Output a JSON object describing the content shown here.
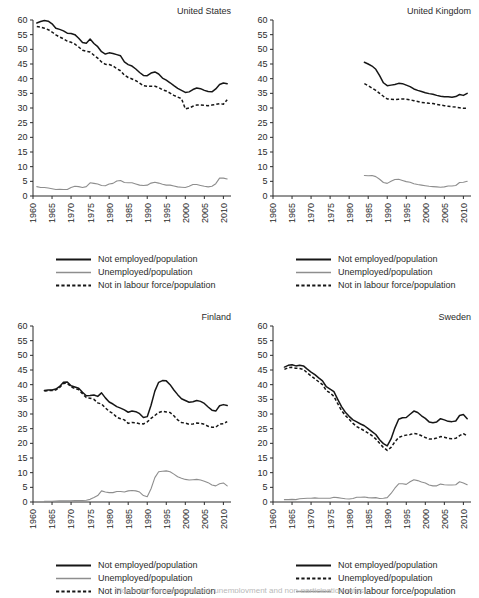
{
  "figure": {
    "panel_count": 4,
    "y_axis": {
      "min": 0,
      "max": 60,
      "ticks": [
        0,
        5,
        10,
        15,
        20,
        25,
        30,
        35,
        40,
        45,
        50,
        55,
        60
      ]
    },
    "x_axis": {
      "min": 1960,
      "max": 2012,
      "ticks": [
        1960,
        1965,
        1970,
        1975,
        1980,
        1985,
        1990,
        1995,
        2000,
        2005,
        2010
      ]
    },
    "series_labels": {
      "not_employed": "Not employed/population",
      "unemployed": "Unemployed/population",
      "not_in_labour_force": "Not in labour force/population"
    },
    "colors": {
      "solid": "#161616",
      "grey": "#8e8e8e",
      "dotted": "#161616",
      "axis": "#2b2b2b"
    },
    "footer_partial_caption": "Figure 3. Non-employment, unemployment and non-participation rates"
  },
  "panels": [
    {
      "id": "united-states",
      "title": "United States",
      "legend": [
        {
          "label": "Not employed/population",
          "key": "solid"
        },
        {
          "label": "Unemployed/population",
          "key": "grey"
        },
        {
          "label": "Not in labour force/population",
          "key": "dotted"
        }
      ]
    },
    {
      "id": "united-kingdom",
      "title": "United Kingdom",
      "legend": [
        {
          "label": "Not employed/population",
          "key": "solid"
        },
        {
          "label": "Unemployed/population",
          "key": "grey"
        },
        {
          "label": "Not in labour force/population",
          "key": "dotted"
        }
      ]
    },
    {
      "id": "finland",
      "title": "Finland",
      "legend": [
        {
          "label": "Not employed/population",
          "key": "solid"
        },
        {
          "label": "Unemployed/population",
          "key": "grey"
        },
        {
          "label": "Not in labour force/population",
          "key": "dotted"
        }
      ]
    },
    {
      "id": "sweden",
      "title": "Sweden",
      "legend": [
        {
          "label": "Not employed/population",
          "key": "solid"
        },
        {
          "label": "Unemployed/population",
          "key": "dotted"
        },
        {
          "label": "Not in labour force/population",
          "key": "grey"
        }
      ]
    }
  ],
  "chart_data": [
    {
      "type": "line",
      "panel": "United States",
      "title": "United States",
      "xlabel": "",
      "ylabel": "",
      "xlim": [
        1960,
        2012
      ],
      "ylim": [
        0,
        60
      ],
      "grid": false,
      "legend_position": "below-plot",
      "x": [
        1961,
        1962,
        1963,
        1964,
        1965,
        1966,
        1967,
        1968,
        1969,
        1970,
        1971,
        1972,
        1973,
        1974,
        1975,
        1976,
        1977,
        1978,
        1979,
        1980,
        1981,
        1982,
        1983,
        1984,
        1985,
        1986,
        1987,
        1988,
        1989,
        1990,
        1991,
        1992,
        1993,
        1994,
        1995,
        1996,
        1997,
        1998,
        1999,
        2000,
        2001,
        2002,
        2003,
        2004,
        2005,
        2006,
        2007,
        2008,
        2009,
        2010,
        2011
      ],
      "series": [
        {
          "name": "Not employed/population",
          "style": "solid",
          "values": [
            59.0,
            59.5,
            59.8,
            59.6,
            58.7,
            57.2,
            56.8,
            56.3,
            55.5,
            55.4,
            55.0,
            53.8,
            52.3,
            52.1,
            53.5,
            52.0,
            50.9,
            49.2,
            48.4,
            48.8,
            48.6,
            48.2,
            47.8,
            45.7,
            44.8,
            44.3,
            43.3,
            42.1,
            41.1,
            41.0,
            41.9,
            42.3,
            41.6,
            40.2,
            39.5,
            38.6,
            37.6,
            36.7,
            36.0,
            35.3,
            35.5,
            36.3,
            36.8,
            36.6,
            36.0,
            35.6,
            35.5,
            36.5,
            38.0,
            38.5,
            38.3
          ]
        },
        {
          "name": "Unemployed/population",
          "style": "grey",
          "values": [
            3.2,
            2.9,
            2.9,
            2.7,
            2.5,
            2.2,
            2.3,
            2.2,
            2.2,
            2.9,
            3.3,
            3.2,
            2.9,
            3.2,
            4.5,
            4.3,
            4.1,
            3.6,
            3.5,
            4.1,
            4.3,
            5.1,
            5.3,
            4.6,
            4.5,
            4.5,
            4.1,
            3.7,
            3.6,
            3.7,
            4.4,
            4.7,
            4.4,
            4.0,
            3.7,
            3.7,
            3.4,
            3.1,
            3.0,
            2.9,
            3.3,
            3.9,
            3.9,
            3.6,
            3.3,
            3.1,
            3.3,
            4.2,
            6.1,
            6.1,
            5.8
          ]
        },
        {
          "name": "Not in labour force/population",
          "style": "dotted",
          "values": [
            57.8,
            57.6,
            57.2,
            56.7,
            55.9,
            54.9,
            54.2,
            53.6,
            52.8,
            52.4,
            51.8,
            50.8,
            49.7,
            49.3,
            49.1,
            48.0,
            47.0,
            45.7,
            44.9,
            44.8,
            44.4,
            43.4,
            42.7,
            41.2,
            40.4,
            39.9,
            39.3,
            38.5,
            37.6,
            37.4,
            37.4,
            37.4,
            37.0,
            36.2,
            35.8,
            35.1,
            34.3,
            33.7,
            33.2,
            29.7,
            30.0,
            30.6,
            31.0,
            31.0,
            30.9,
            30.8,
            31.0,
            31.2,
            31.5,
            31.3,
            32.8
          ]
        }
      ]
    },
    {
      "type": "line",
      "panel": "United Kingdom",
      "title": "United Kingdom",
      "xlabel": "",
      "ylabel": "",
      "xlim": [
        1960,
        2012
      ],
      "ylim": [
        0,
        60
      ],
      "grid": false,
      "legend_position": "below-plot",
      "x": [
        1984,
        1985,
        1986,
        1987,
        1988,
        1989,
        1990,
        1991,
        1992,
        1993,
        1994,
        1995,
        1996,
        1997,
        1998,
        1999,
        2000,
        2001,
        2002,
        2003,
        2004,
        2005,
        2006,
        2007,
        2008,
        2009,
        2010,
        2011
      ],
      "series": [
        {
          "name": "Not employed/population",
          "style": "solid",
          "values": [
            45.6,
            45.0,
            44.3,
            43.2,
            41.0,
            38.6,
            37.6,
            37.8,
            38.0,
            38.4,
            38.3,
            37.8,
            37.3,
            36.5,
            36.0,
            35.6,
            35.2,
            34.9,
            34.7,
            34.3,
            34.0,
            33.8,
            33.8,
            33.7,
            33.9,
            34.6,
            34.3,
            35.0
          ]
        },
        {
          "name": "Unemployed/population",
          "style": "grey",
          "values": [
            7.0,
            6.9,
            7.0,
            6.6,
            5.7,
            4.6,
            4.3,
            5.0,
            5.6,
            5.7,
            5.3,
            4.9,
            4.7,
            4.2,
            3.9,
            3.7,
            3.5,
            3.3,
            3.2,
            3.1,
            3.0,
            3.1,
            3.4,
            3.4,
            3.6,
            4.6,
            4.7,
            5.0
          ]
        },
        {
          "name": "Not in labour force/population",
          "style": "dotted",
          "values": [
            38.3,
            37.6,
            36.8,
            36.0,
            35.0,
            34.0,
            33.1,
            33.0,
            32.9,
            33.0,
            33.1,
            33.0,
            32.8,
            32.5,
            32.2,
            31.9,
            31.8,
            31.6,
            31.5,
            31.2,
            31.0,
            30.8,
            30.6,
            30.4,
            30.3,
            30.1,
            29.9,
            29.9
          ]
        }
      ]
    },
    {
      "type": "line",
      "panel": "Finland",
      "title": "Finland",
      "xlabel": "",
      "ylabel": "",
      "xlim": [
        1960,
        2012
      ],
      "ylim": [
        0,
        60
      ],
      "grid": false,
      "legend_position": "below-plot",
      "x": [
        1963,
        1964,
        1965,
        1966,
        1967,
        1968,
        1969,
        1970,
        1971,
        1972,
        1973,
        1974,
        1975,
        1976,
        1977,
        1978,
        1979,
        1980,
        1981,
        1982,
        1983,
        1984,
        1985,
        1986,
        1987,
        1988,
        1989,
        1990,
        1991,
        1992,
        1993,
        1994,
        1995,
        1996,
        1997,
        1998,
        1999,
        2000,
        2001,
        2002,
        2003,
        2004,
        2005,
        2006,
        2007,
        2008,
        2009,
        2010,
        2011
      ],
      "series": [
        {
          "name": "Not employed/population",
          "style": "solid",
          "values": [
            38.0,
            38.2,
            38.2,
            38.5,
            39.4,
            40.8,
            40.9,
            39.6,
            39.2,
            38.8,
            37.4,
            36.2,
            36.3,
            36.5,
            36.0,
            37.2,
            35.5,
            34.1,
            33.4,
            32.5,
            32.0,
            31.4,
            30.6,
            31.0,
            30.8,
            30.1,
            28.8,
            29.1,
            33.0,
            37.8,
            40.8,
            41.4,
            41.3,
            40.0,
            38.2,
            36.6,
            35.2,
            34.6,
            34.0,
            34.2,
            34.6,
            34.3,
            33.6,
            32.4,
            31.3,
            31.0,
            32.8,
            33.2,
            32.9
          ]
        },
        {
          "name": "Unemployed/population",
          "style": "grey",
          "values": [
            0.2,
            0.2,
            0.2,
            0.3,
            0.4,
            0.4,
            0.4,
            0.4,
            0.5,
            0.5,
            0.5,
            0.6,
            0.9,
            1.5,
            2.2,
            3.8,
            3.4,
            3.2,
            3.2,
            3.6,
            3.6,
            3.4,
            3.8,
            3.9,
            3.8,
            3.4,
            2.2,
            1.8,
            4.5,
            8.3,
            10.3,
            10.5,
            10.6,
            10.3,
            9.5,
            8.6,
            8.1,
            7.7,
            7.5,
            7.6,
            7.7,
            7.5,
            7.1,
            6.6,
            5.8,
            5.5,
            6.2,
            6.5,
            5.5
          ]
        },
        {
          "name": "Not in labour force/population",
          "style": "dotted",
          "values": [
            37.8,
            38.0,
            38.0,
            38.2,
            39.0,
            40.4,
            40.5,
            39.2,
            38.7,
            38.3,
            36.9,
            35.6,
            35.4,
            35.0,
            33.8,
            33.4,
            32.1,
            30.9,
            30.2,
            28.9,
            28.4,
            28.0,
            26.8,
            27.1,
            27.0,
            26.7,
            26.6,
            27.3,
            28.5,
            29.5,
            30.5,
            30.9,
            30.7,
            30.5,
            29.4,
            28.0,
            27.1,
            26.9,
            26.5,
            26.6,
            26.9,
            26.8,
            26.5,
            25.8,
            25.5,
            25.5,
            26.6,
            26.7,
            27.4
          ]
        }
      ]
    },
    {
      "type": "line",
      "panel": "Sweden",
      "title": "Sweden",
      "xlabel": "",
      "ylabel": "",
      "xlim": [
        1960,
        2012
      ],
      "ylim": [
        0,
        60
      ],
      "grid": false,
      "legend_position": "below-plot",
      "x": [
        1963,
        1964,
        1965,
        1966,
        1967,
        1968,
        1969,
        1970,
        1971,
        1972,
        1973,
        1974,
        1975,
        1976,
        1977,
        1978,
        1979,
        1980,
        1981,
        1982,
        1983,
        1984,
        1985,
        1986,
        1987,
        1988,
        1989,
        1990,
        1991,
        1992,
        1993,
        1994,
        1995,
        1996,
        1997,
        1998,
        1999,
        2000,
        2001,
        2002,
        2003,
        2004,
        2005,
        2006,
        2007,
        2008,
        2009,
        2010,
        2011
      ],
      "series": [
        {
          "name": "Not employed/population",
          "style": "solid",
          "values": [
            46.0,
            46.6,
            46.8,
            46.4,
            46.6,
            46.4,
            45.3,
            44.3,
            43.4,
            42.3,
            41.3,
            39.3,
            38.5,
            37.6,
            35.0,
            32.5,
            30.6,
            29.2,
            28.0,
            27.3,
            26.6,
            26.0,
            25.0,
            24.0,
            23.0,
            21.2,
            19.9,
            19.1,
            21.5,
            25.2,
            28.2,
            28.7,
            28.8,
            29.9,
            31.0,
            30.5,
            29.4,
            28.5,
            27.3,
            27.0,
            27.3,
            28.4,
            28.0,
            27.5,
            27.4,
            27.6,
            29.5,
            29.8,
            28.4
          ]
        },
        {
          "name": "Unemployed/population",
          "style": "dotted",
          "values": [
            45.2,
            45.8,
            45.9,
            45.6,
            45.5,
            45.2,
            44.0,
            43.0,
            42.0,
            41.0,
            40.0,
            38.0,
            37.2,
            36.0,
            33.5,
            31.2,
            29.5,
            28.2,
            26.8,
            25.7,
            25.0,
            24.3,
            23.5,
            22.6,
            21.5,
            20.0,
            18.6,
            17.6,
            18.6,
            20.5,
            22.0,
            22.5,
            22.8,
            23.0,
            23.4,
            23.2,
            22.6,
            22.0,
            21.5,
            21.5,
            21.8,
            22.3,
            22.1,
            21.7,
            21.6,
            21.7,
            22.6,
            23.3,
            22.5
          ]
        },
        {
          "name": "Not in labour force/population",
          "style": "grey",
          "values": [
            0.8,
            0.8,
            0.9,
            0.8,
            1.1,
            1.2,
            1.3,
            1.3,
            1.4,
            1.3,
            1.3,
            1.3,
            1.3,
            1.6,
            1.5,
            1.3,
            1.1,
            1.0,
            1.2,
            1.6,
            1.6,
            1.7,
            1.5,
            1.4,
            1.5,
            1.2,
            1.3,
            1.5,
            2.9,
            4.7,
            6.2,
            6.2,
            6.0,
            6.9,
            7.6,
            7.3,
            6.8,
            6.5,
            5.8,
            5.5,
            5.5,
            6.1,
            5.9,
            5.8,
            5.8,
            5.9,
            6.9,
            6.5,
            5.9
          ]
        }
      ]
    }
  ]
}
